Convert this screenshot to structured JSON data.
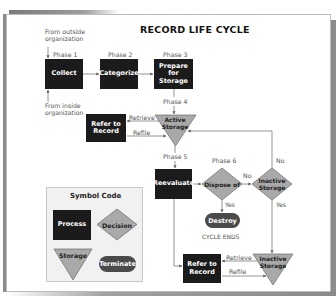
{
  "diagram": {
    "title": "RECORD LIFE CYCLE",
    "sources": {
      "outside": "From outside organization",
      "outside_line1": "From outside",
      "outside_line2": "organization",
      "inside": "From inside organization",
      "inside_line1": "From inside",
      "inside_line2": "organization"
    },
    "phases": {
      "p1": "Phase 1",
      "p2": "Phase 2",
      "p3": "Phase 3",
      "p4": "Phase 4",
      "p5": "Phase 5",
      "p6": "Phase 6"
    },
    "nodes": {
      "collect": "Collect",
      "categorize": "Categorize",
      "prepare_line1": "Prepare",
      "prepare_line2": "for",
      "prepare_line3": "Storage",
      "refer_top_line1": "Refer to",
      "refer_top_line2": "Record",
      "active_storage_line1": "Active",
      "active_storage_line2": "Storage",
      "reevaluate": "Reevaluate",
      "dispose_of": "Dispose of",
      "inactive_decision_line1": "Inactive",
      "inactive_decision_line2": "Storage",
      "destroy": "Destroy",
      "refer_bottom_line1": "Refer to",
      "refer_bottom_line2": "Record",
      "inactive_storage_line1": "Inactive",
      "inactive_storage_line2": "Storage"
    },
    "edge_labels": {
      "retrieve_top": "Retrieve",
      "refile_top": "Refile",
      "no_dispose": "No",
      "yes_dispose": "Yes",
      "no_inactive": "No",
      "yes_inactive": "Yes",
      "retrieve_bottom": "Retrieve",
      "refile_bottom": "Refile",
      "cycle_ends": "CYCLE ENDS"
    },
    "legend": {
      "title": "Symbol Code",
      "process": "Process",
      "decision": "Decision",
      "storage": "Storage",
      "terminate": "Terminate"
    },
    "colors": {
      "process": "#1b1b1b",
      "decision": "#a9a9a9",
      "storage": "#a9a9a9",
      "terminate": "#4a4a4a",
      "lines": "#777777"
    }
  }
}
